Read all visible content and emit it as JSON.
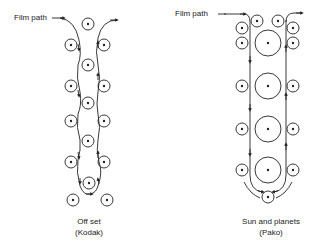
{
  "left_diagram": {
    "name": "Off set",
    "maker": "(Kodak)",
    "film_path_label": "Film path",
    "rollers": [
      {
        "cx": 88,
        "cy": 24,
        "r": 6
      },
      {
        "cx": 71,
        "cy": 45,
        "r": 6
      },
      {
        "cx": 104,
        "cy": 45,
        "r": 6
      },
      {
        "cx": 88,
        "cy": 65,
        "r": 6
      },
      {
        "cx": 71,
        "cy": 86,
        "r": 6
      },
      {
        "cx": 104,
        "cy": 86,
        "r": 6
      },
      {
        "cx": 88,
        "cy": 103,
        "r": 6
      },
      {
        "cx": 71,
        "cy": 121,
        "r": 6
      },
      {
        "cx": 104,
        "cy": 121,
        "r": 6
      },
      {
        "cx": 88,
        "cy": 141,
        "r": 6
      },
      {
        "cx": 71,
        "cy": 162,
        "r": 6
      },
      {
        "cx": 104,
        "cy": 162,
        "r": 6
      },
      {
        "cx": 89,
        "cy": 183,
        "r": 6
      },
      {
        "cx": 73,
        "cy": 200,
        "r": 6
      },
      {
        "cx": 107,
        "cy": 200,
        "r": 6
      }
    ]
  },
  "right_diagram": {
    "name": "Sun and planets",
    "maker": "(Pako)",
    "film_path_label": "Film path",
    "rollers": [
      {
        "cx": 257,
        "cy": 21,
        "r": 6
      },
      {
        "cx": 278,
        "cy": 21,
        "r": 6
      },
      {
        "cx": 242,
        "cy": 28,
        "r": 6
      },
      {
        "cx": 293,
        "cy": 28,
        "r": 6
      },
      {
        "cx": 242,
        "cy": 43,
        "r": 6
      },
      {
        "cx": 293,
        "cy": 43,
        "r": 6
      },
      {
        "cx": 268,
        "cy": 43,
        "r": 13
      },
      {
        "cx": 242,
        "cy": 86,
        "r": 6
      },
      {
        "cx": 293,
        "cy": 86,
        "r": 6
      },
      {
        "cx": 268,
        "cy": 86,
        "r": 13
      },
      {
        "cx": 242,
        "cy": 129,
        "r": 6
      },
      {
        "cx": 293,
        "cy": 129,
        "r": 6
      },
      {
        "cx": 268,
        "cy": 129,
        "r": 13
      },
      {
        "cx": 242,
        "cy": 170,
        "r": 6
      },
      {
        "cx": 293,
        "cy": 170,
        "r": 6
      },
      {
        "cx": 268,
        "cy": 170,
        "r": 13
      },
      {
        "cx": 268,
        "cy": 197,
        "r": 6
      }
    ]
  }
}
